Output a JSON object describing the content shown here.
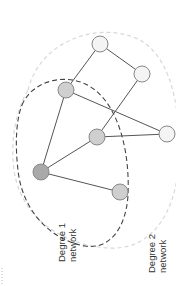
{
  "diagram": {
    "colors": {
      "edge": "#555555",
      "degree1_outline": "#444444",
      "degree2_outline": "#d8d8d8",
      "node_stroke": "#888888",
      "ego_fill": "#a9a9a9",
      "degree1_fill": "#cfcfcf",
      "degree2_fill": "#f4f4f4"
    },
    "nodes": [
      {
        "id": "n1",
        "x": 100,
        "y": 44,
        "r": 8,
        "type": "degree2"
      },
      {
        "id": "n2",
        "x": 142,
        "y": 74,
        "r": 8,
        "type": "degree2"
      },
      {
        "id": "n3",
        "x": 66,
        "y": 90,
        "r": 8,
        "type": "degree1"
      },
      {
        "id": "n4",
        "x": 167,
        "y": 134,
        "r": 8,
        "type": "degree2"
      },
      {
        "id": "n5",
        "x": 97,
        "y": 137,
        "r": 8,
        "type": "degree1"
      },
      {
        "id": "n6",
        "x": 41,
        "y": 172,
        "r": 8,
        "type": "ego"
      },
      {
        "id": "n7",
        "x": 120,
        "y": 192,
        "r": 8,
        "type": "degree1"
      }
    ],
    "edges": [
      [
        "n1",
        "n2"
      ],
      [
        "n1",
        "n3"
      ],
      [
        "n2",
        "n5"
      ],
      [
        "n3",
        "n4"
      ],
      [
        "n3",
        "n6"
      ],
      [
        "n5",
        "n4"
      ],
      [
        "n5",
        "n6"
      ],
      [
        "n6",
        "n7"
      ]
    ],
    "labels": {
      "degree1": {
        "line1": "Degree 1",
        "line2": "network"
      },
      "degree2": {
        "line1": "Degree 2",
        "line2": "network"
      }
    }
  }
}
